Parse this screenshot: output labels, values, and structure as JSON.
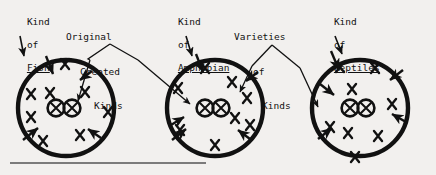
{
  "figure": {
    "background_color": "#f2f0ee",
    "ink_color": "#111111",
    "baseline_rule": {
      "x1": 10,
      "x2": 206,
      "y": 163
    }
  },
  "labels": {
    "fish": {
      "line1": "Kind",
      "line2": "of",
      "line3": "Fish",
      "underlined": "Fish"
    },
    "amphibian": {
      "line1": "Kind",
      "line2": "of",
      "line3": "Amphibian",
      "underlined": "Amphibian"
    },
    "reptiles": {
      "line1": "Kind",
      "line2": "of",
      "line3": "Reptiles",
      "underlined": "Reptiles"
    },
    "original": {
      "line1": "Original",
      "line2": "Created",
      "line3": "Kinds"
    },
    "varieties": {
      "line1": "Varieties",
      "line2": "of",
      "line3": "Kinds"
    }
  },
  "diagram": {
    "circles": [
      {
        "name": "fish-circle",
        "cx": 66,
        "cy": 108,
        "r": 48
      },
      {
        "name": "amphibian-circle",
        "cx": 215,
        "cy": 108,
        "r": 48
      },
      {
        "name": "reptiles-circle",
        "cx": 360,
        "cy": 108,
        "r": 48
      }
    ],
    "core_pairs": [
      {
        "name": "fish-core",
        "cx1": 56,
        "cx2": 72,
        "cy": 108,
        "r": 8
      },
      {
        "name": "amphibian-core",
        "cx1": 205,
        "cx2": 221,
        "cy": 108,
        "r": 8
      },
      {
        "name": "reptiles-core",
        "cx1": 350,
        "cx2": 366,
        "cy": 108,
        "r": 8
      }
    ],
    "x_marks": {
      "fish": [
        [
          56,
          72
        ],
        [
          31,
          94
        ],
        [
          50,
          93
        ],
        [
          85,
          92
        ],
        [
          31,
          117
        ],
        [
          108,
          112
        ],
        [
          43,
          141
        ],
        [
          80,
          135
        ]
      ],
      "amphibian": [
        [
          205,
          69
        ],
        [
          178,
          88
        ],
        [
          232,
          82
        ],
        [
          247,
          98
        ],
        [
          235,
          118
        ],
        [
          180,
          130
        ],
        [
          250,
          125
        ],
        [
          215,
          145
        ]
      ],
      "reptiles": [
        [
          340,
          68
        ],
        [
          375,
          69
        ],
        [
          352,
          90
        ],
        [
          392,
          105
        ],
        [
          330,
          128
        ],
        [
          348,
          133
        ],
        [
          378,
          136
        ],
        [
          355,
          158
        ]
      ]
    },
    "boundary_arrows": 8,
    "pointer_count": 4
  }
}
